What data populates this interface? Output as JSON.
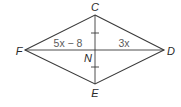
{
  "diagram": {
    "type": "rhombus",
    "vertices": {
      "C": {
        "label": "C",
        "x": 95,
        "y": 15
      },
      "D": {
        "label": "D",
        "x": 164,
        "y": 50
      },
      "E": {
        "label": "E",
        "x": 95,
        "y": 84
      },
      "F": {
        "label": "F",
        "x": 25,
        "y": 50
      }
    },
    "intersection": {
      "label": "N",
      "x": 95,
      "y": 50
    },
    "segments": {
      "FN": {
        "label": "5x − 8"
      },
      "ND": {
        "label": "3x"
      }
    },
    "tick_marks": {
      "CN": 1,
      "NE": 1
    },
    "colors": {
      "stroke": "#3a3a3a",
      "label": "#2a2a2a",
      "expression": "#5a5a5a"
    }
  }
}
